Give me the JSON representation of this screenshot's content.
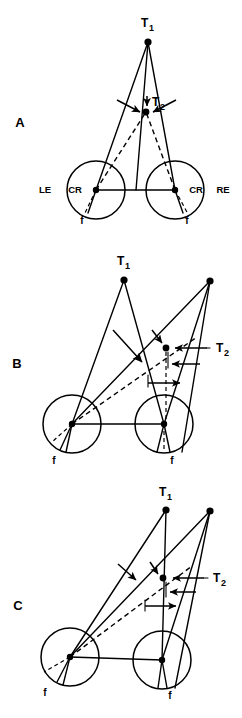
{
  "figure": {
    "title_text": "",
    "background_color": "#ffffff",
    "ink_color": "#000000",
    "width": 242,
    "height": 718
  },
  "panels": [
    {
      "id": "A",
      "letter": "A",
      "letter_pos": {
        "x": 20,
        "y": 127
      },
      "targets": {
        "t1": {
          "label": "T",
          "subscript": "1",
          "label_pos": {
            "x": 141,
            "y": 27
          },
          "point": {
            "x": 148,
            "y": 42
          }
        },
        "t2": {
          "label": "T",
          "subscript": "2",
          "label_pos": {
            "x": 152,
            "y": 106
          },
          "point": {
            "x": 146,
            "y": 112
          }
        }
      },
      "eyes": [
        {
          "side": "left",
          "eye_label": "LE",
          "eye_label_pos": {
            "x": 45,
            "y": 193
          },
          "center_label": "CR",
          "center_label_pos": {
            "x": 73,
            "y": 193
          },
          "center": {
            "x": 96,
            "y": 190
          },
          "radius": 29,
          "fovea_label": "f",
          "fovea_label_pos": {
            "x": 82,
            "y": 222
          }
        },
        {
          "side": "right",
          "eye_label": "RE",
          "eye_label_pos": {
            "x": 205,
            "y": 193
          },
          "center_label": "CR",
          "center_label_pos": {
            "x": 180,
            "y": 193
          },
          "center": {
            "x": 175,
            "y": 190
          },
          "radius": 29,
          "fovea_label": "f",
          "fovea_label_pos": {
            "x": 186,
            "y": 222
          }
        }
      ],
      "notes": "Symmetric convergence: both visual axes from CR of each eye to T1; dashed lines to T2; arrows converge on T2"
    },
    {
      "id": "B",
      "letter": "B",
      "letter_pos": {
        "x": 17,
        "y": 368
      },
      "targets": {
        "t1": {
          "label": "T",
          "subscript": "1",
          "label_pos": {
            "x": 117,
            "y": 265
          },
          "point": {
            "x": 124,
            "y": 280
          }
        },
        "t2": {
          "label": "T",
          "subscript": "2",
          "label_pos": {
            "x": 216,
            "y": 352
          },
          "point": {
            "x": 166,
            "y": 348
          }
        },
        "aux": {
          "point": {
            "x": 210,
            "y": 281
          }
        }
      },
      "eyes": [
        {
          "side": "left",
          "center": {
            "x": 72,
            "y": 424
          },
          "radius": 29,
          "fovea_label": "f",
          "fovea_label_pos": {
            "x": 54,
            "y": 461
          }
        },
        {
          "side": "right",
          "center": {
            "x": 164,
            "y": 424
          },
          "radius": 29,
          "fovea_label": "f",
          "fovea_label_pos": {
            "x": 172,
            "y": 461
          }
        }
      ],
      "notes": "Asymmetric convergence with disparity arrows at T2"
    },
    {
      "id": "C",
      "letter": "C",
      "letter_pos": {
        "x": 18,
        "y": 610
      },
      "targets": {
        "t1": {
          "label": "T",
          "subscript": "1",
          "label_pos": {
            "x": 159,
            "y": 496
          },
          "point": {
            "x": 166,
            "y": 510
          }
        },
        "t2": {
          "label": "T",
          "subscript": "2",
          "label_pos": {
            "x": 213,
            "y": 582
          },
          "point": {
            "x": 163,
            "y": 578
          }
        },
        "aux": {
          "point": {
            "x": 210,
            "y": 511
          }
        }
      },
      "eyes": [
        {
          "side": "left",
          "center": {
            "x": 70,
            "y": 657
          },
          "radius": 29,
          "fovea_label": "f",
          "fovea_label_pos": {
            "x": 45,
            "y": 692
          }
        },
        {
          "side": "right",
          "center": {
            "x": 162,
            "y": 660
          },
          "radius": 29,
          "fovea_label": "f",
          "fovea_label_pos": {
            "x": 170,
            "y": 695
          }
        }
      ],
      "notes": "Asymmetric convergence, alternate fixation geometry"
    }
  ],
  "legend": {
    "solid_line_meaning": "visual axis / line of sight",
    "dashed_line_meaning": "corresponding retinal projection",
    "dot_meaning": "target point",
    "circle_meaning": "eyeball",
    "f_meaning": "fovea",
    "cr_meaning": "center of rotation",
    "le_meaning": "left eye",
    "re_meaning": "right eye"
  }
}
